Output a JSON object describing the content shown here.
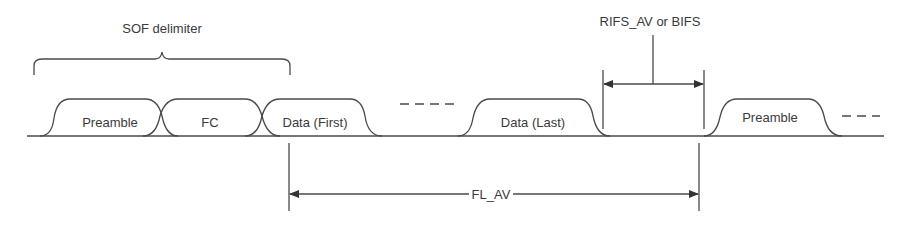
{
  "diagram": {
    "sof_delimiter_label": "SOF delimiter",
    "gap_label": "RIFS_AV or BIFS",
    "frame_length_label": "FL_AV",
    "pulses": [
      {
        "label": "Preamble"
      },
      {
        "label": "FC"
      },
      {
        "label": "Data (First)"
      },
      {
        "label": "Data (Last)"
      },
      {
        "label": "Preamble"
      }
    ],
    "colors": {
      "line": "#4a4a4a",
      "text": "#3a3a3a",
      "background": "#ffffff"
    }
  }
}
